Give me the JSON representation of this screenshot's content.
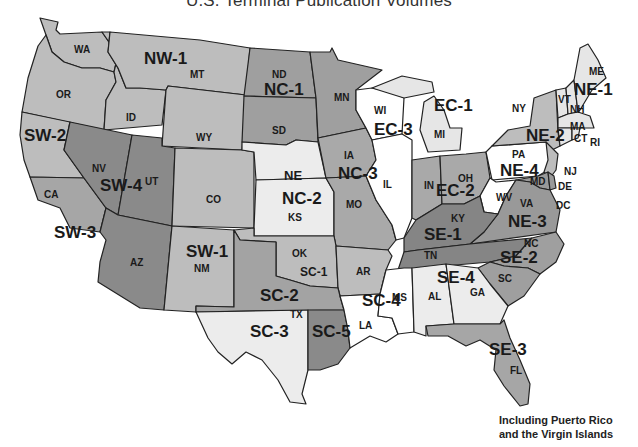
{
  "title": "U.S. Terminal Publication Volumes",
  "note": {
    "line1": "Including Puerto Rico",
    "line2": "and the Virgin Islands"
  },
  "shades": {
    "white": "#ffffff",
    "light": "#e6e6e6",
    "medium": "#bdbdbd",
    "dark": "#9a9a9a",
    "darker": "#7e7e7e",
    "border": "#222222"
  },
  "regions": [
    {
      "code": "NW-1",
      "states": [
        "WA",
        "OR",
        "ID",
        "MT",
        "WY"
      ],
      "shade": "medium"
    },
    {
      "code": "NC-1",
      "states": [
        "ND",
        "SD",
        "MN"
      ],
      "shade": "dark"
    },
    {
      "code": "NC-2",
      "states": [
        "NE",
        "KS"
      ],
      "shade": "light"
    },
    {
      "code": "NC-3",
      "states": [
        "IA",
        "MO"
      ],
      "shade": "dark"
    },
    {
      "code": "EC-1",
      "states": [
        "MI"
      ],
      "shade": "light"
    },
    {
      "code": "EC-2",
      "states": [
        "IN",
        "OH"
      ],
      "shade": "dark"
    },
    {
      "code": "EC-3",
      "states": [
        "WI",
        "IL"
      ],
      "shade": "white"
    },
    {
      "code": "NE-1",
      "states": [
        "ME",
        "VT",
        "NH",
        "MA",
        "RI",
        "CT"
      ],
      "shade": "light"
    },
    {
      "code": "NE-2",
      "states": [
        "NY",
        "NJ"
      ],
      "shade": "medium"
    },
    {
      "code": "NE-3",
      "states": [
        "VA",
        "MD",
        "DE",
        "DC"
      ],
      "shade": "dark"
    },
    {
      "code": "NE-4",
      "states": [
        "PA",
        "WV"
      ],
      "shade": "white"
    },
    {
      "code": "SW-1",
      "states": [
        "CO",
        "NM"
      ],
      "shade": "medium"
    },
    {
      "code": "SW-2",
      "states": [
        "CA (north)"
      ],
      "shade": "medium"
    },
    {
      "code": "SW-3",
      "states": [
        "CA (south)"
      ],
      "shade": "dark"
    },
    {
      "code": "SW-4",
      "states": [
        "NV",
        "UT",
        "AZ"
      ],
      "shade": "darker"
    },
    {
      "code": "SC-1",
      "states": [
        "OK",
        "AR"
      ],
      "shade": "medium"
    },
    {
      "code": "SC-2",
      "states": [
        "TX (north)"
      ],
      "shade": "dark"
    },
    {
      "code": "SC-3",
      "states": [
        "TX (west)"
      ],
      "shade": "light"
    },
    {
      "code": "SC-4",
      "states": [
        "LA",
        "MS"
      ],
      "shade": "white"
    },
    {
      "code": "SC-5",
      "states": [
        "TX (east)"
      ],
      "shade": "darker"
    },
    {
      "code": "SE-1",
      "states": [
        "KY",
        "TN"
      ],
      "shade": "darker"
    },
    {
      "code": "SE-2",
      "states": [
        "NC",
        "SC"
      ],
      "shade": "dark"
    },
    {
      "code": "SE-3",
      "states": [
        "FL"
      ],
      "shade": "dark"
    },
    {
      "code": "SE-4",
      "states": [
        "AL",
        "GA"
      ],
      "shade": "light"
    }
  ],
  "labels": {
    "states": {
      "WA": "WA",
      "OR": "OR",
      "ID": "ID",
      "MT": "MT",
      "WY": "WY",
      "ND": "ND",
      "SD": "SD",
      "MN": "MN",
      "NE": "NE",
      "KS": "KS",
      "IA": "IA",
      "MO": "MO",
      "WI": "WI",
      "IL": "IL",
      "MI": "MI",
      "IN": "IN",
      "OH": "OH",
      "NY": "NY",
      "VT": "VT",
      "NH": "NH",
      "ME": "ME",
      "MA": "MA",
      "CT": "CT",
      "RI": "RI",
      "PA": "PA",
      "NJ": "NJ",
      "DE": "DE",
      "DC": "DC",
      "MD": "MD",
      "VA": "VA",
      "WV": "WV",
      "KY": "KY",
      "TN": "TN",
      "NC": "NC",
      "SC": "SC",
      "GA": "GA",
      "AL": "AL",
      "MS": "MS",
      "LA": "LA",
      "FL": "FL",
      "AR": "AR",
      "OK": "OK",
      "TX": "TX",
      "NM": "NM",
      "CO": "CO",
      "AZ": "AZ",
      "UT": "UT",
      "NV": "NV",
      "CA": "CA"
    },
    "regions": {
      "NW1": "NW-1",
      "NC1": "NC-1",
      "NC2": "NC-2",
      "NC3": "NC-3",
      "EC1": "EC-1",
      "EC2": "EC-2",
      "EC3": "EC-3",
      "NE1": "NE-1",
      "NE2": "NE-2",
      "NE3": "NE-3",
      "NE4": "NE-4",
      "SW1": "SW-1",
      "SW2": "SW-2",
      "SW3": "SW-3",
      "SW4": "SW-4",
      "SC1": "SC-1",
      "SC2": "SC-2",
      "SC3": "SC-3",
      "SC4": "SC-4",
      "SC5": "SC-5",
      "SE1": "SE-1",
      "SE2": "SE-2",
      "SE3": "SE-3",
      "SE4": "SE-4"
    }
  }
}
